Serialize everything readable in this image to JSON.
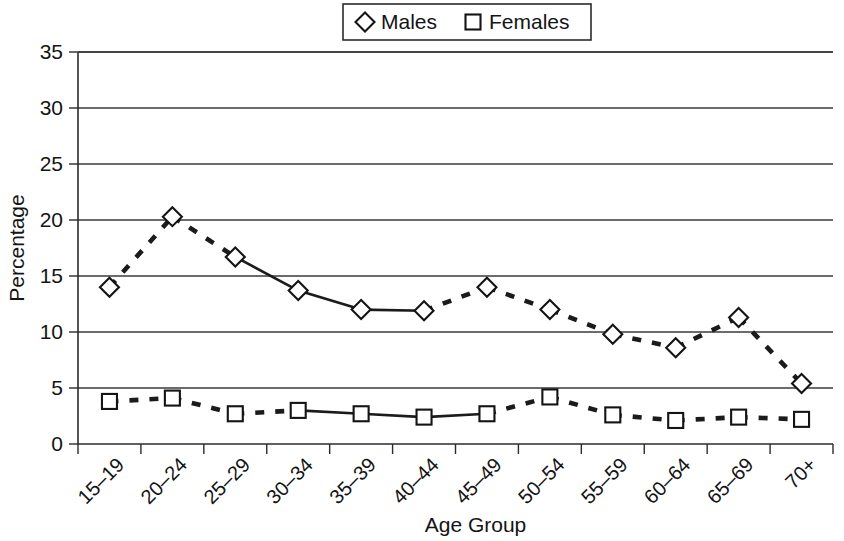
{
  "chart_data": {
    "type": "line",
    "title": "",
    "xlabel": "Age Group",
    "ylabel": "Percentage",
    "ylim": [
      0,
      35
    ],
    "ytick_step": 5,
    "yticks": [
      "0",
      "5",
      "10",
      "15",
      "20",
      "25",
      "30",
      "35"
    ],
    "grid": "horizontal",
    "legend_position": "top-center",
    "categories": [
      "15–19",
      "20–24",
      "25–29",
      "30–34",
      "35–39",
      "40–44",
      "45–49",
      "50–54",
      "55–59",
      "60–64",
      "65–69",
      "70+"
    ],
    "series": [
      {
        "name": "Males",
        "marker": "diamond",
        "values": [
          14.0,
          20.3,
          16.7,
          13.7,
          12.0,
          11.9,
          14.0,
          12.0,
          9.8,
          8.6,
          11.3,
          5.4
        ],
        "segment_styles": [
          "dashed",
          "dashed",
          "solid",
          "solid",
          "solid",
          "dashed",
          "dashed",
          "dashed",
          "dashed",
          "dashed",
          "dashed"
        ]
      },
      {
        "name": "Females",
        "marker": "square",
        "values": [
          3.8,
          4.1,
          2.7,
          3.0,
          2.7,
          2.4,
          2.7,
          4.2,
          2.6,
          2.1,
          2.4,
          2.2
        ],
        "segment_styles": [
          "dashed",
          "dashed",
          "dashed",
          "solid",
          "solid",
          "solid",
          "dashed",
          "dashed",
          "dashed",
          "dashed",
          "dashed"
        ]
      }
    ]
  },
  "legend": {
    "entries": [
      {
        "label": "Males",
        "marker": "diamond"
      },
      {
        "label": "Females",
        "marker": "square"
      }
    ]
  },
  "colors": {
    "series_stroke": "#141414",
    "marker_fill": "#ffffff",
    "grid": "#3a3a3a",
    "axis": "#2b2b2b",
    "background": "#ffffff"
  }
}
